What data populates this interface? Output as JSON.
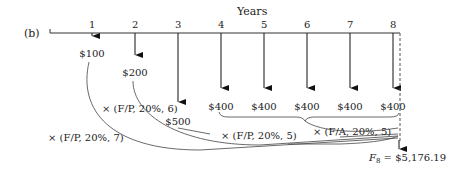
{
  "diagram": {
    "panel_label": "(b)",
    "axis_title": "Years",
    "years": [
      "1",
      "2",
      "3",
      "4",
      "5",
      "6",
      "7",
      "8"
    ],
    "cash_flows": [
      {
        "year": 1,
        "label": "$100",
        "amount": 100
      },
      {
        "year": 2,
        "label": "$200",
        "amount": 200
      },
      {
        "year": 3,
        "label": "$500",
        "amount": 500
      },
      {
        "year": 4,
        "label": "$400",
        "amount": 400
      },
      {
        "year": 5,
        "label": "$400",
        "amount": 400
      },
      {
        "year": 6,
        "label": "$400",
        "amount": 400
      },
      {
        "year": 7,
        "label": "$400",
        "amount": 400
      },
      {
        "year": 8,
        "label": "$400",
        "amount": 400
      }
    ],
    "factors": {
      "fp7": "× (F/P, 20%, 7)",
      "fp6": "× (F/P, 20%, 6)",
      "fp5": "× (F/P, 20%, 5)",
      "fa5": "× (F/A, 20%, 5)"
    },
    "future_value": {
      "symbol": "F",
      "subscript": "8",
      "text": " = $5,176.19",
      "amount": 5176.19
    }
  }
}
